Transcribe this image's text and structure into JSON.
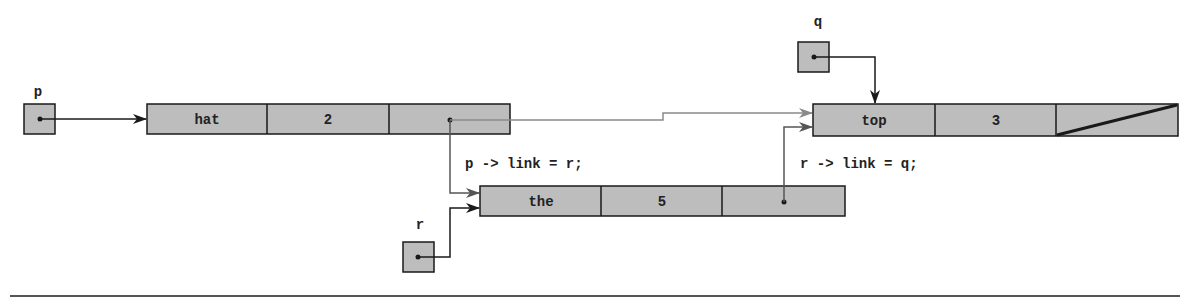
{
  "diagram": {
    "colors": {
      "node_fill": "#bdbdbd",
      "border": "#1a1a1a",
      "old_link": "#8a8a8a",
      "new_link": "#555555",
      "background": "#ffffff"
    },
    "pointers": [
      {
        "id": "p",
        "label": "p",
        "points_to": "hat"
      },
      {
        "id": "q",
        "label": "q",
        "points_to": "top"
      },
      {
        "id": "r",
        "label": "r",
        "points_to": "the"
      }
    ],
    "nodes": [
      {
        "id": "hat",
        "data": "hat",
        "count": "2",
        "link": "the (formerly top)"
      },
      {
        "id": "the",
        "data": "the",
        "count": "5",
        "link": "top"
      },
      {
        "id": "top",
        "data": "top",
        "count": "3",
        "link": "NULL"
      }
    ],
    "statements": [
      {
        "id": "stmt1",
        "text": "p -> link = r;"
      },
      {
        "id": "stmt2",
        "text": "r -> link = q;"
      }
    ]
  }
}
